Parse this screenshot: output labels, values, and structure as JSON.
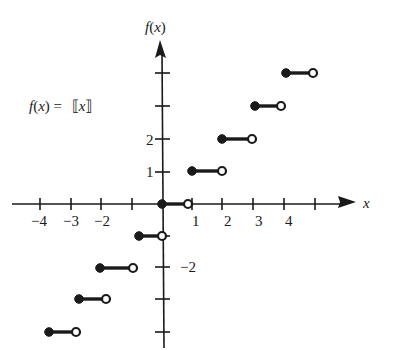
{
  "chart_data": {
    "type": "line",
    "subtype": "step-function",
    "function_label": "f(x) = ⟦x⟧",
    "xlabel": "x",
    "ylabel": "f(x)",
    "x_tick_labels": [
      "-4",
      "-3",
      "-2",
      "1",
      "2",
      "3",
      "4"
    ],
    "y_tick_labels": [
      "2",
      "1",
      "-2"
    ],
    "x_ticks": [
      -4,
      -3,
      -2,
      -1,
      1,
      2,
      3,
      4,
      5
    ],
    "y_ticks": [
      -4,
      -3,
      -2,
      -1,
      1,
      2,
      3,
      4
    ],
    "xlim": [
      -4.5,
      6
    ],
    "ylim": [
      -4.5,
      5
    ],
    "grid": false,
    "legend": "none",
    "series": [
      {
        "name": "greatest integer function",
        "segments": [
          {
            "x_start": -4,
            "x_end": -3,
            "y": -4,
            "start": "closed",
            "end": "open"
          },
          {
            "x_start": -3,
            "x_end": -2,
            "y": -3,
            "start": "closed",
            "end": "open"
          },
          {
            "x_start": -2,
            "x_end": -1,
            "y": -2,
            "start": "closed",
            "end": "open"
          },
          {
            "x_start": -1,
            "x_end": 0,
            "y": -1,
            "start": "closed",
            "end": "open"
          },
          {
            "x_start": 0,
            "x_end": 1,
            "y": 0,
            "start": "closed",
            "end": "open"
          },
          {
            "x_start": 1,
            "x_end": 2,
            "y": 1,
            "start": "closed",
            "end": "open"
          },
          {
            "x_start": 2,
            "x_end": 3,
            "y": 2,
            "start": "closed",
            "end": "open"
          },
          {
            "x_start": 3,
            "x_end": 4,
            "y": 3,
            "start": "closed",
            "end": "open"
          },
          {
            "x_start": 4,
            "x_end": 5,
            "y": 4,
            "start": "closed",
            "end": "open"
          }
        ]
      }
    ]
  },
  "labels": {
    "function": {
      "f": "f",
      "open": "(",
      "x": "x",
      "close": ")",
      "eq": " = ",
      "bl": "⟦",
      "bx": "x",
      "br": "⟧"
    },
    "y_axis": {
      "f": "f",
      "open": "(",
      "x": "x",
      "close": ")"
    },
    "x_axis": "x"
  },
  "render": {
    "origin": [
      162,
      204
    ],
    "x_tick_px": [
      40,
      71,
      101,
      132,
      192,
      222,
      253,
      284,
      315
    ],
    "y_tick_px": [
      332,
      299,
      267,
      236,
      172,
      139,
      106,
      73
    ],
    "x_tick_label_px": [
      {
        "text": "−4",
        "x": 31,
        "y": 226
      },
      {
        "text": "−3",
        "x": 63,
        "y": 226
      },
      {
        "text": "−2",
        "x": 94,
        "y": 226
      },
      {
        "text": "1",
        "x": 192,
        "y": 226
      },
      {
        "text": "2",
        "x": 224,
        "y": 226
      },
      {
        "text": "3",
        "x": 255,
        "y": 226
      },
      {
        "text": "4",
        "x": 285,
        "y": 226
      }
    ],
    "y_tick_label_px": [
      {
        "text": "2",
        "x": 146,
        "y": 145
      },
      {
        "text": "1",
        "x": 146,
        "y": 177
      },
      {
        "text": "−2",
        "x": 180,
        "y": 272
      }
    ],
    "segments_px": [
      {
        "x1": 49,
        "x2": 76,
        "y": 332
      },
      {
        "x1": 79,
        "x2": 106,
        "y": 299
      },
      {
        "x1": 100,
        "x2": 133,
        "y": 268
      },
      {
        "x1": 139,
        "x2": 162,
        "y": 236
      },
      {
        "x1": 162,
        "x2": 188,
        "y": 204
      },
      {
        "x1": 192,
        "x2": 222,
        "y": 171
      },
      {
        "x1": 222,
        "x2": 252,
        "y": 139
      },
      {
        "x1": 255,
        "x2": 281,
        "y": 106
      },
      {
        "x1": 286,
        "x2": 313,
        "y": 73
      }
    ]
  }
}
